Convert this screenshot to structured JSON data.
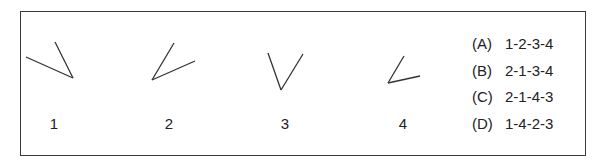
{
  "figures": [
    {
      "label": "1",
      "vertex": [
        73,
        78
      ],
      "arms": [
        [
          26,
          57
        ],
        [
          55,
          42
        ]
      ],
      "label_x": 54
    },
    {
      "label": "2",
      "vertex": [
        152,
        80
      ],
      "arms": [
        [
          174,
          43
        ],
        [
          195,
          61
        ]
      ],
      "label_x": 169
    },
    {
      "label": "3",
      "vertex": [
        281,
        90
      ],
      "arms": [
        [
          268,
          53
        ],
        [
          303,
          54
        ]
      ],
      "label_x": 285
    },
    {
      "label": "4",
      "vertex": [
        388,
        83
      ],
      "arms": [
        [
          404,
          56
        ],
        [
          420,
          76
        ]
      ],
      "label_x": 403
    }
  ],
  "options": [
    {
      "letter": "(A)",
      "sequence": "1-2-3-4"
    },
    {
      "letter": "(B)",
      "sequence": "2-1-3-4"
    },
    {
      "letter": "(C)",
      "sequence": "2-1-4-3"
    },
    {
      "letter": "(D)",
      "sequence": "1-4-2-3"
    }
  ],
  "colors": {
    "stroke": "#333333",
    "text": "#222222",
    "border": "#3a3a3a"
  }
}
